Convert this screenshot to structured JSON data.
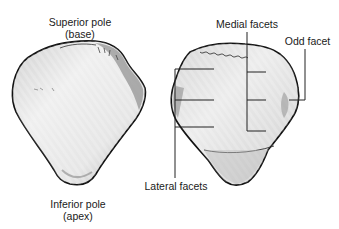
{
  "figure": {
    "left_view": {
      "name": "anterior-view",
      "labels": {
        "superior_line1": "Superior pole",
        "superior_line2": "(base)",
        "inferior_line1": "Inferior pole",
        "inferior_line2": "(apex)"
      }
    },
    "right_view": {
      "name": "posterior-view",
      "labels": {
        "medial": "Medial facets",
        "odd": "Odd facet",
        "lateral": "Lateral facets"
      }
    },
    "colors": {
      "outline": "#111111",
      "bone_fill": "#e4e4e4",
      "bone_shade": "#9a9a9a",
      "leader_line": "#222222",
      "text": "#1a1a1a"
    }
  }
}
